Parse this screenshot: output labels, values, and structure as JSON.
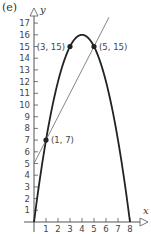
{
  "panel_label": "(e)",
  "colors": {
    "axis": "#555555",
    "parabola": "#222222",
    "line": "#777777",
    "points": "#222222",
    "text": "#444444"
  },
  "chart_data": {
    "type": "line",
    "title": "",
    "panel": "(e)",
    "xlabel": "x",
    "ylabel": "y",
    "xlim": [
      0,
      8.8
    ],
    "ylim": [
      0,
      18
    ],
    "x_ticks": [
      1,
      2,
      3,
      4,
      5,
      6,
      7,
      8
    ],
    "y_ticks": [
      1,
      2,
      3,
      4,
      5,
      6,
      7,
      8,
      9,
      10,
      11,
      12,
      13,
      14,
      15,
      16,
      17
    ],
    "grid": false,
    "legend": null,
    "series": [
      {
        "name": "parabola",
        "equation": "y = -x^2 + 8x",
        "style": "thick dark curve",
        "x": [
          0,
          1,
          2,
          3,
          4,
          5,
          6,
          7,
          8
        ],
        "y": [
          0,
          7,
          12,
          15,
          16,
          15,
          12,
          7,
          0
        ]
      },
      {
        "name": "line",
        "equation": "y = 2x + 5",
        "style": "thin grey line",
        "x": [
          0,
          6.25
        ],
        "y": [
          5,
          17.5
        ]
      }
    ],
    "annotations": [
      {
        "x": 1,
        "y": 7,
        "label": "(1, 7)"
      },
      {
        "x": 3,
        "y": 15,
        "label": "(3, 15)"
      },
      {
        "x": 5,
        "y": 15,
        "label": "(5, 15)"
      }
    ]
  }
}
